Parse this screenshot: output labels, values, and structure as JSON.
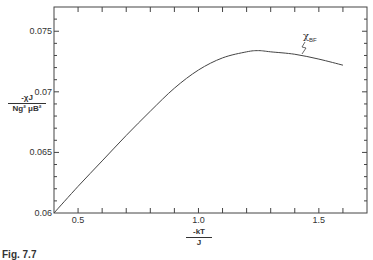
{
  "chart_data": {
    "type": "line",
    "title": "",
    "xlabel": "-kT / J",
    "xlabel_num": "-kT",
    "xlabel_den": "J",
    "ylabel": "-χJ / Ng² μB²",
    "ylabel_num": "-χJ",
    "ylabel_den": "Ng² μB²",
    "xlim": [
      0.4,
      1.7
    ],
    "ylim": [
      0.06,
      0.077
    ],
    "xticks": [
      0.5,
      1.0,
      1.5
    ],
    "xtick_labels": [
      "0.5",
      "1.0",
      "1.5"
    ],
    "yticks": [
      0.06,
      0.065,
      0.07,
      0.075
    ],
    "ytick_labels": [
      "0.06",
      "0.065",
      "0.07",
      "0.075"
    ],
    "grid": false,
    "series": [
      {
        "name": "χBF",
        "label_main": "χ",
        "label_sub": "BF",
        "x": [
          0.4,
          0.5,
          0.6,
          0.7,
          0.8,
          0.9,
          1.0,
          1.1,
          1.2,
          1.25,
          1.3,
          1.4,
          1.5,
          1.6
        ],
        "values": [
          0.06,
          0.0622,
          0.0643,
          0.0664,
          0.0684,
          0.0703,
          0.0718,
          0.0728,
          0.0733,
          0.0734,
          0.0733,
          0.0731,
          0.0727,
          0.0722
        ]
      }
    ]
  },
  "caption": {
    "prefix": "Fig. 7.7",
    "rest": " The (cut off)"
  }
}
